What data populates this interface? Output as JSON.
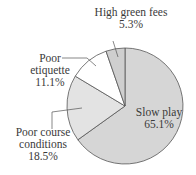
{
  "chart_data": {
    "type": "pie",
    "title": "",
    "categories": [
      "Slow play",
      "Poor course conditions",
      "Poor etiquette",
      "High green fees"
    ],
    "values": [
      65.1,
      18.5,
      11.1,
      5.3
    ],
    "value_labels": [
      "65.1%",
      "18.5%",
      "11.1%",
      "5.3%"
    ],
    "colors": [
      "#d6d6d6",
      "#e3e3e3",
      "#ffffff",
      "#cfcfcf"
    ],
    "start_angle": "12 o'clock",
    "direction": "clockwise",
    "legend": "none (direct labels)"
  },
  "labels": {
    "slow_play": {
      "name": "Slow play",
      "pct": "65.1%"
    },
    "course": {
      "name1": "Poor course",
      "name2": "conditions",
      "pct": "18.5%"
    },
    "etiquette": {
      "name1": "Poor",
      "name2": "etiquette",
      "pct": "11.1%"
    },
    "fees": {
      "name": "High green fees",
      "pct": "5.3%"
    }
  }
}
